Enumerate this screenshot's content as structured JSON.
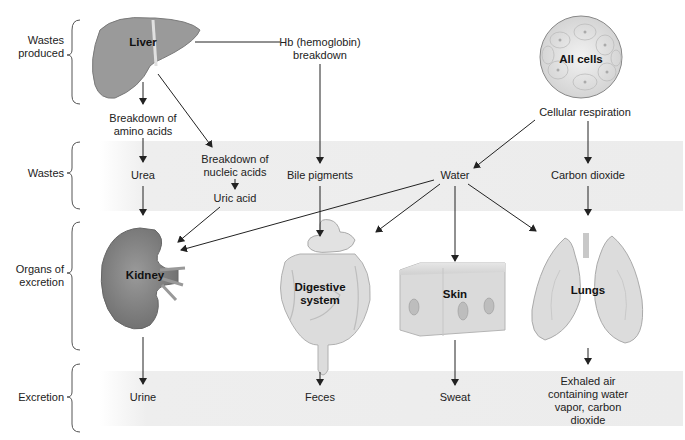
{
  "rows": {
    "wastes_produced": "Wastes\nproduced",
    "wastes": "Wastes",
    "organs_of_excretion": "Organs of\nexcretion",
    "excretion": "Excretion"
  },
  "sources": {
    "liver": "Liver",
    "hb_breakdown": "Hb (hemoglobin)\nbreakdown",
    "all_cells": "All cells",
    "cellular_respiration": "Cellular respiration",
    "breakdown_amino_acids": "Breakdown of\namino acids",
    "breakdown_nucleic_acids": "Breakdown of\nnucleic acids"
  },
  "wastes": {
    "urea": "Urea",
    "uric_acid": "Uric acid",
    "bile_pigments": "Bile pigments",
    "water": "Water",
    "carbon_dioxide": "Carbon dioxide"
  },
  "organs": {
    "kidney": "Kidney",
    "digestive_system": "Digestive\nsystem",
    "skin": "Skin",
    "lungs": "Lungs"
  },
  "excretion": {
    "urine": "Urine",
    "feces": "Feces",
    "sweat": "Sweat",
    "exhaled_air": "Exhaled air\ncontaining water\nvapor, carbon\ndioxide"
  },
  "colors": {
    "band": "#ececec",
    "organ_dark": "#8a8a8a",
    "organ_light": "#d8d8d8",
    "arrow": "#222222"
  }
}
